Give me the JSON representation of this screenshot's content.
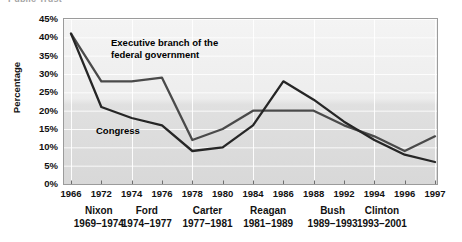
{
  "top_caption": "Public Trust",
  "chart_data": {
    "type": "line",
    "title": "",
    "subtitle": "",
    "xlabel": "",
    "ylabel": "Percentage",
    "ylim": [
      0,
      45
    ],
    "ytick_values": [
      45,
      40,
      35,
      30,
      25,
      20,
      15,
      10,
      5,
      0
    ],
    "ytick_labels": [
      "45%",
      "40%",
      "35%",
      "30%",
      "25%",
      "20%",
      "15%",
      "10%",
      "5%",
      "0%"
    ],
    "grid": true,
    "legend_position": "inline-annotations",
    "x": [
      1966,
      1972,
      1974,
      1976,
      1978,
      1980,
      1984,
      1986,
      1988,
      1992,
      1994,
      1996,
      1997
    ],
    "xtick_labels": [
      "1966",
      "1972",
      "1974",
      "1976",
      "1978",
      "1980",
      "1984",
      "1986",
      "1988",
      "1992",
      "1994",
      "1996",
      "1997"
    ],
    "series": [
      {
        "name": "Executive branch of the federal government",
        "color": "#4a4a4a",
        "values": [
          41,
          28,
          28,
          29,
          12,
          15,
          20,
          20,
          20,
          16,
          13,
          9,
          13
        ]
      },
      {
        "name": "Congress",
        "color": "#262626",
        "values": [
          41,
          21,
          18,
          16,
          9,
          10,
          16,
          28,
          23,
          17,
          12,
          8,
          6
        ]
      }
    ],
    "annotations": [
      {
        "text": "Executive branch of the\nfederal government",
        "x": 1974,
        "y": 34
      },
      {
        "text": "Congress",
        "x": 1973,
        "y": 16
      }
    ],
    "x_groups": [
      {
        "name": "Nixon",
        "term": "1969–1974",
        "center_year": 1971.5
      },
      {
        "name": "Ford",
        "term": "1974–1977",
        "center_year": 1975.0
      },
      {
        "name": "Carter",
        "term": "1977–1981",
        "center_year": 1979.0
      },
      {
        "name": "Reagan",
        "term": "1981–1989",
        "center_year": 1985.0
      },
      {
        "name": "Bush",
        "term": "1989–1993",
        "center_year": 1990.5
      },
      {
        "name": "Clinton",
        "term": "1993–2001",
        "center_year": 1994.5
      }
    ]
  }
}
